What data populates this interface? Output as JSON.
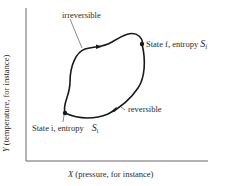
{
  "diagram": {
    "x_axis": {
      "var": "X",
      "label": " (pressure, for instance)"
    },
    "y_axis": {
      "var": "Y",
      "label": " (temperature, for instance)"
    },
    "path_labels": {
      "irreversible": "irreversible",
      "reversible": "reversible"
    },
    "state_i": {
      "label": "State i, entropy ",
      "symbol": "S",
      "subscript": "i"
    },
    "state_f": {
      "label": "State f, entropy ",
      "symbol": "S",
      "subscript": "f"
    },
    "colors": {
      "line": "#1a1a1a",
      "axis": "#555555",
      "text": "#2a2a2a"
    }
  }
}
